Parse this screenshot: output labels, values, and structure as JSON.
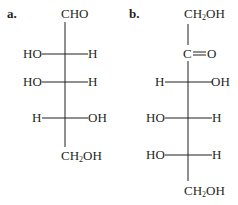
{
  "figure": {
    "structures": [
      {
        "label": "a.",
        "top": "CHO",
        "rows": [
          {
            "left": "HO",
            "right": "H"
          },
          {
            "left": "HO",
            "right": "H"
          },
          {
            "left": "H",
            "right": "OH"
          }
        ],
        "bottom": {
          "prefix": "CH",
          "sub": "2",
          "suffix": "OH"
        }
      },
      {
        "label": "b.",
        "top": {
          "prefix": "CH",
          "sub": "2",
          "suffix": "OH"
        },
        "carbonyl": "C=O",
        "carbonyl_c": "C",
        "carbonyl_o": "O",
        "rows": [
          {
            "left": "H",
            "right": "OH"
          },
          {
            "left": "HO",
            "right": "H"
          },
          {
            "left": "HO",
            "right": "H"
          }
        ],
        "bottom": {
          "prefix": "CH",
          "sub": "2",
          "suffix": "OH"
        }
      }
    ]
  }
}
